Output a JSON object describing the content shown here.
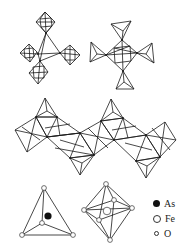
{
  "figure": {
    "panels": [
      {
        "id": "tetrahedron-cluster",
        "label": "AsO4 tetrahedron linked to four FeO6 octahedra"
      },
      {
        "id": "octahedron-cluster",
        "label": "FeO6 octahedron linked to four AsO4 tetrahedra"
      },
      {
        "id": "chain",
        "label": "Zig-zag chain of corner-sharing polyhedra"
      },
      {
        "id": "tetrahedron-detail",
        "label": "AsO4 tetrahedron"
      },
      {
        "id": "octahedron-detail",
        "label": "FeO6 octahedron"
      }
    ]
  },
  "legend": {
    "items": [
      {
        "label": "As",
        "symbol": "filled-circle",
        "color": "#111111"
      },
      {
        "label": "Fe",
        "symbol": "large-open-circle",
        "color": "#ffffff"
      },
      {
        "label": "O",
        "symbol": "small-open-circle",
        "color": "#ffffff"
      }
    ]
  }
}
